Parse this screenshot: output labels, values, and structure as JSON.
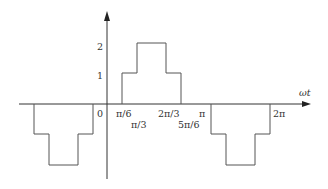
{
  "diagram": {
    "type": "stepped-waveform",
    "axis": {
      "x_label": "ωt",
      "origin_label": "0"
    },
    "y_ticks": [
      {
        "label": "1",
        "value": 1
      },
      {
        "label": "2",
        "value": 2
      }
    ],
    "x_ticks": [
      {
        "label": "π/6"
      },
      {
        "label": "π/3"
      },
      {
        "label": "2π/3"
      },
      {
        "label": "5π/6"
      },
      {
        "label": "π"
      },
      {
        "label": "2π"
      }
    ],
    "segments": [
      {
        "name": "negative-pulse-left",
        "levels": [
          -1,
          -2,
          -1
        ]
      },
      {
        "name": "positive-pulse",
        "from": "π/6",
        "to": "5π/6",
        "levels": [
          1,
          2,
          1
        ],
        "steps": [
          "π/6",
          "π/3",
          "2π/3",
          "5π/6"
        ]
      },
      {
        "name": "negative-pulse-right",
        "levels": [
          -1,
          -2,
          -1
        ]
      }
    ],
    "colors": {
      "axis": "#333333",
      "waveform": "#555555"
    }
  }
}
